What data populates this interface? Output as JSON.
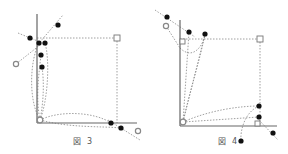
{
  "figures": [
    {
      "caption": "図 3",
      "caption_symbol": "図",
      "caption_number": "3",
      "axes": {
        "origin": [
          37,
          123
        ],
        "y_top": 14,
        "x_right": 137
      },
      "corner_square": [
        117,
        38
      ],
      "origin_marker": [
        40,
        120
      ],
      "filled_points": [
        [
          58,
          25
        ],
        [
          30,
          38
        ],
        [
          39,
          43
        ],
        [
          45,
          43
        ],
        [
          41,
          55
        ],
        [
          42,
          67
        ],
        [
          111,
          123
        ],
        [
          121,
          128
        ]
      ],
      "open_points": [
        [
          16,
          64
        ],
        [
          138,
          131
        ]
      ]
    },
    {
      "caption": "図 4",
      "caption_symbol": "図",
      "caption_number": "4",
      "axes": {
        "origin": [
          180,
          126
        ],
        "y_top": 20,
        "x_right": 277
      },
      "corner_square": [
        260,
        39
      ],
      "origin_marker": [
        183,
        122
      ],
      "filled_points": [
        [
          167,
          17
        ],
        [
          189,
          32
        ],
        [
          205,
          34
        ],
        [
          259,
          106
        ],
        [
          259,
          117
        ],
        [
          273,
          133
        ],
        [
          241,
          141
        ]
      ],
      "open_points": [
        [
          166,
          26
        ]
      ]
    }
  ]
}
